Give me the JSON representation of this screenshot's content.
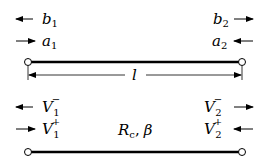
{
  "diagram": {
    "top_section": {
      "title": "Scattering (wave) variables on a two-port line",
      "left_port": {
        "out_wave": {
          "symbol": "b",
          "subscript": "1",
          "arrow": "left"
        },
        "in_wave": {
          "symbol": "a",
          "subscript": "1",
          "arrow": "right"
        }
      },
      "right_port": {
        "out_wave": {
          "symbol": "b",
          "subscript": "2",
          "arrow": "right"
        },
        "in_wave": {
          "symbol": "a",
          "subscript": "2",
          "arrow": "left"
        }
      },
      "length_label": "l"
    },
    "bottom_section": {
      "left_port": {
        "reflected": {
          "symbol": "V",
          "subscript": "1",
          "superscript": "−",
          "arrow": "left"
        },
        "incident": {
          "symbol": "V",
          "subscript": "1",
          "superscript": "+",
          "arrow": "right"
        }
      },
      "right_port": {
        "reflected": {
          "symbol": "V",
          "subscript": "2",
          "superscript": "−",
          "arrow": "right"
        },
        "incident": {
          "symbol": "V",
          "subscript": "2",
          "superscript": "+",
          "arrow": "left"
        }
      },
      "line_params": {
        "impedance_symbol": "R",
        "impedance_subscript": "c",
        "separator": ",",
        "propagation_symbol": "β"
      }
    },
    "colors": {
      "stroke": "#000000",
      "background": "#ffffff",
      "terminal_fill": "#ffffff"
    }
  }
}
